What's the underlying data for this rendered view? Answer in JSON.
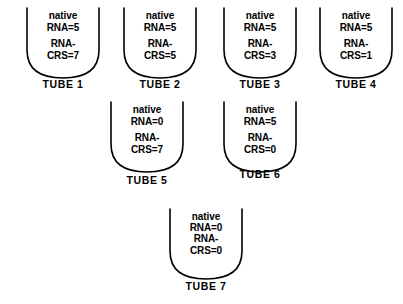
{
  "figure": {
    "background_color": "#ffffff",
    "stroke_color": "#000000",
    "text_color": "#000000",
    "tubes": [
      {
        "id": "tube-1",
        "native_rna_line1": "native",
        "native_rna_line2": "RNA=5",
        "crs_line1": "RNA-",
        "crs_line2": "CRS=7",
        "label": "TUBE 1",
        "native_rna_value": 5,
        "rna_crs_value": 7,
        "x": 20,
        "y": 6,
        "label_y": 72,
        "tight": false
      },
      {
        "id": "tube-2",
        "native_rna_line1": "native",
        "native_rna_line2": "RNA=5",
        "crs_line1": "RNA-",
        "crs_line2": "CRS=5",
        "label": "TUBE 2",
        "native_rna_value": 5,
        "rna_crs_value": 5,
        "x": 117,
        "y": 6,
        "label_y": 72,
        "tight": false
      },
      {
        "id": "tube-3",
        "native_rna_line1": "native",
        "native_rna_line2": "RNA=5",
        "crs_line1": "RNA-",
        "crs_line2": "CRS=3",
        "label": "TUBE 3",
        "native_rna_value": 5,
        "rna_crs_value": 3,
        "x": 217,
        "y": 6,
        "label_y": 72,
        "tight": false
      },
      {
        "id": "tube-4",
        "native_rna_line1": "native",
        "native_rna_line2": "RNA=5",
        "crs_line1": "RNA-",
        "crs_line2": "CRS=1",
        "label": "TUBE 4",
        "native_rna_value": 5,
        "rna_crs_value": 1,
        "x": 313,
        "y": 6,
        "label_y": 72,
        "tight": false
      },
      {
        "id": "tube-5",
        "native_rna_line1": "native",
        "native_rna_line2": "RNA=0",
        "crs_line1": "RNA-",
        "crs_line2": "CRS=7",
        "label": "TUBE 5",
        "native_rna_value": 0,
        "rna_crs_value": 7,
        "x": 104,
        "y": 100,
        "label_y": 74,
        "tight": false
      },
      {
        "id": "tube-6",
        "native_rna_line1": "native",
        "native_rna_line2": "RNA=5",
        "crs_line1": "RNA-",
        "crs_line2": "CRS=0",
        "label": "TUBE 6",
        "native_rna_value": 5,
        "rna_crs_value": 0,
        "x": 217,
        "y": 100,
        "label_y": 68,
        "tight": false
      },
      {
        "id": "tube-7",
        "native_rna_line1": "native",
        "native_rna_line2": "RNA=0",
        "crs_line1": "RNA-",
        "crs_line2": "CRS=0",
        "label": "TUBE 7",
        "native_rna_value": 0,
        "rna_crs_value": 0,
        "x": 163,
        "y": 207,
        "label_y": 73,
        "tight": true
      }
    ]
  }
}
